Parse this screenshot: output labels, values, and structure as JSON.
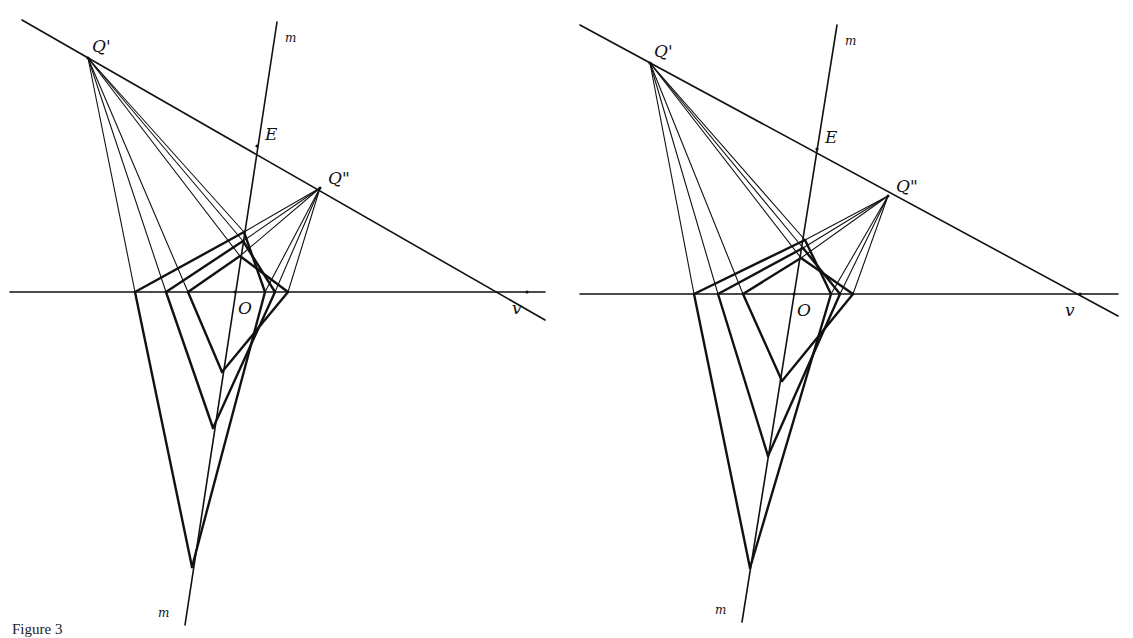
{
  "figure": {
    "caption": "Figure 3",
    "panels": [
      {
        "id": "left",
        "labels": {
          "q1": "Q'",
          "q2": "Q\"",
          "e": "E",
          "o": "O",
          "v": "v",
          "m_top": "m",
          "m_bottom": "m"
        }
      },
      {
        "id": "right",
        "labels": {
          "q1": "Q'",
          "q2": "Q\"",
          "e": "E",
          "o": "O",
          "v": "v",
          "m_top": "m",
          "m_bottom": "m"
        }
      }
    ]
  }
}
